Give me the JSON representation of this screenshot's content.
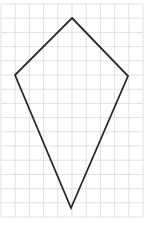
{
  "figure": {
    "type": "kite-on-grid",
    "grid": {
      "origin_x": 1,
      "origin_y": 4,
      "spacing": 14.2,
      "cols": 10,
      "rows": 15,
      "color": "#d9d9d9"
    },
    "shape": {
      "name": "kite",
      "vertices": [
        {
          "label": "top",
          "x": 72,
          "y": 18
        },
        {
          "label": "right",
          "x": 128,
          "y": 76
        },
        {
          "label": "bottom",
          "x": 71,
          "y": 208
        },
        {
          "label": "left",
          "x": 15,
          "y": 75
        }
      ],
      "stroke": "#2b2b2b",
      "stroke_width": 1.8
    }
  }
}
